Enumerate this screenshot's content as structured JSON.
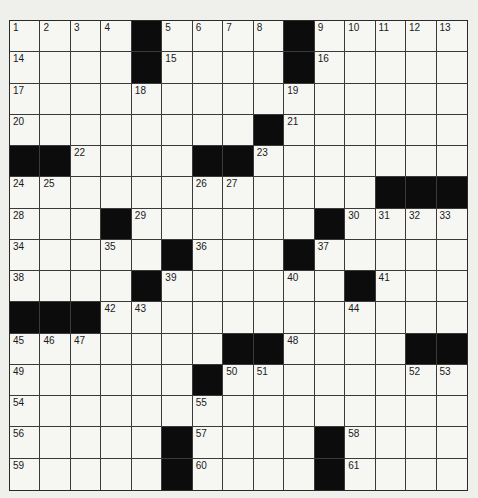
{
  "puzzle": {
    "type": "crossword",
    "rows": 15,
    "cols": 15,
    "colors": {
      "background": "#efefec",
      "cell": "#f6f6f3",
      "block": "#0c0c0c",
      "line": "#3a3a3a"
    },
    "grid": [
      [
        "1",
        "2",
        "3",
        "4",
        "#",
        "5",
        "6",
        "7",
        "8",
        "#",
        "9",
        "10",
        "11",
        "12",
        "13"
      ],
      [
        "14",
        "",
        "",
        "",
        "#",
        "15",
        "",
        "",
        "",
        "#",
        "16",
        "",
        "",
        "",
        ""
      ],
      [
        "17",
        "",
        "",
        "",
        "18",
        "",
        "",
        "",
        "",
        "19",
        "",
        "",
        "",
        "",
        ""
      ],
      [
        "20",
        "",
        "",
        "",
        "",
        "",
        "",
        "",
        "#",
        "21",
        "",
        "",
        "",
        "",
        ""
      ],
      [
        "#",
        "#",
        "22",
        "",
        "",
        "",
        "#",
        "#",
        "23",
        "",
        "",
        "",
        "",
        "",
        ""
      ],
      [
        "24",
        "25",
        "",
        "",
        "",
        "",
        "26",
        "27",
        "",
        "",
        "",
        "",
        "#",
        "#",
        "#"
      ],
      [
        "28",
        "",
        "",
        "#",
        "29",
        "",
        "",
        "",
        "",
        "",
        "#",
        "30",
        "31",
        "32",
        "33"
      ],
      [
        "34",
        "",
        "",
        "35",
        "",
        "#",
        "36",
        "",
        "",
        "#",
        "37",
        "",
        "",
        "",
        ""
      ],
      [
        "38",
        "",
        "",
        "",
        "#",
        "39",
        "",
        "",
        "",
        "40",
        "",
        "#",
        "41",
        "",
        ""
      ],
      [
        "#",
        "#",
        "#",
        "42",
        "43",
        "",
        "",
        "",
        "",
        "",
        "",
        "44",
        "",
        "",
        ""
      ],
      [
        "45",
        "46",
        "47",
        "",
        "",
        "",
        "",
        "#",
        "#",
        "48",
        "",
        "",
        "",
        "#",
        "#"
      ],
      [
        "49",
        "",
        "",
        "",
        "",
        "",
        "#",
        "50",
        "51",
        "",
        "",
        "",
        "",
        "52",
        "53"
      ],
      [
        "54",
        "",
        "",
        "",
        "",
        "",
        "55",
        "",
        "",
        "",
        "",
        "",
        "",
        "",
        ""
      ],
      [
        "56",
        "",
        "",
        "",
        "",
        "#",
        "57",
        "",
        "",
        "",
        "#",
        "58",
        "",
        "",
        ""
      ],
      [
        "59",
        "",
        "",
        "",
        "",
        "#",
        "60",
        "",
        "",
        "",
        "#",
        "61",
        "",
        "",
        ""
      ]
    ]
  }
}
